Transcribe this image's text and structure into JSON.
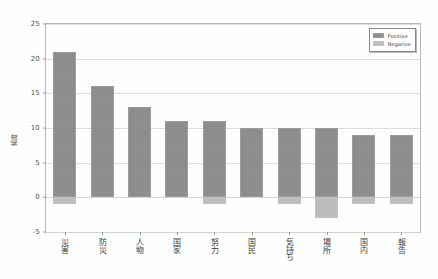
{
  "chart_data": {
    "type": "bar",
    "title": "",
    "xlabel": "",
    "ylabel": "頻度",
    "ylim": [
      -5,
      25
    ],
    "yticks": [
      25,
      20,
      15,
      10,
      5,
      0,
      -5
    ],
    "grid": true,
    "legend_position": "upper right",
    "categories": [
      "災害",
      "防災",
      "人物",
      "国家",
      "努力",
      "国民",
      "気持ち",
      "場所",
      "国内",
      "報告"
    ],
    "series": [
      {
        "name": "Positive",
        "values": [
          21,
          16,
          13,
          11,
          11,
          10,
          10,
          10,
          9,
          9
        ],
        "color": "#8e8e8e"
      },
      {
        "name": "Negative",
        "values": [
          -1,
          0,
          0,
          0,
          -1,
          0,
          -1,
          -3,
          -1,
          -1
        ],
        "color": "#bdbdbd"
      }
    ]
  },
  "legend": {
    "entries": [
      {
        "label": "Positive",
        "swatch": "pos"
      },
      {
        "label": "Negative",
        "swatch": "neg"
      }
    ]
  },
  "axis": {
    "y_title": "頻度",
    "y_tick_labels": [
      "25",
      "20",
      "15",
      "10",
      "5",
      "0",
      "-5"
    ]
  }
}
